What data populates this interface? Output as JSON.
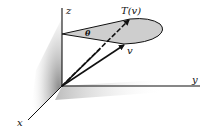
{
  "figure": {
    "labels": {
      "z_axis": "z",
      "y_axis": "y",
      "x_axis": "x",
      "vector_v": "v",
      "vector_tv": "T(v)",
      "angle": "θ"
    },
    "colors": {
      "ink": "#111111",
      "cone_fill": "#bdbdbd",
      "shadow": "#888888",
      "background": "#ffffff"
    }
  }
}
